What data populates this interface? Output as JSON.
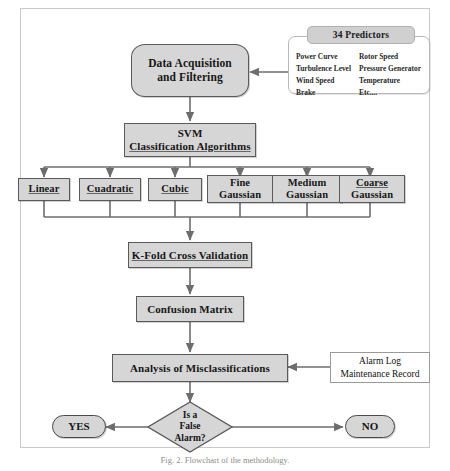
{
  "figure": {
    "caption": "Fig. 2. Flowchart of the methodology."
  },
  "colors": {
    "node_fill": "#d6d6d6",
    "node_border": "#5a5a5a",
    "legend_fill": "#ffffff",
    "legend_title_fill": "#d0d0d0",
    "connector": "#6d6d6d",
    "frame": "#c9c9c9"
  },
  "nodes": {
    "data_acquisition": {
      "line1": "Data Acquisition",
      "line2": "and Filtering",
      "shape": "terminator"
    },
    "svm": {
      "line1": "SVM",
      "line2": "Classification Algorithms",
      "shape": "process"
    },
    "kfold": {
      "label": "K-Fold Cross Validation",
      "shape": "process"
    },
    "confusion": {
      "label": "Confusion Matrix",
      "shape": "process"
    },
    "analysis": {
      "label": "Analysis of  Misclassifications",
      "shape": "process"
    },
    "decision": {
      "line1": "Is a",
      "line2": "False",
      "line3": "Alarm?",
      "shape": "diamond"
    },
    "yes": {
      "label": "YES",
      "shape": "terminator"
    },
    "no": {
      "label": "NO",
      "shape": "terminator"
    }
  },
  "kernels": [
    {
      "line1": "Linear",
      "line2": ""
    },
    {
      "line1": "Cuadratic",
      "line2": ""
    },
    {
      "line1": "Cubic",
      "line2": ""
    },
    {
      "line1": "Fine",
      "line2": "Gaussian"
    },
    {
      "line1": "Medium",
      "line2": "Gaussian"
    },
    {
      "line1": "Coarse",
      "line2": "Gaussian"
    }
  ],
  "predictors_legend": {
    "title": "34 Predictors",
    "column_left": [
      "Power Curve",
      "Turbulence Level",
      "Wind Speed",
      "Brake"
    ],
    "column_right": [
      "Rotor Speed",
      " Pressure Generator",
      "Temperature",
      "Etc...."
    ]
  },
  "records_note": {
    "line1": "Alarm Log",
    "line2": "Maintenance Record"
  }
}
